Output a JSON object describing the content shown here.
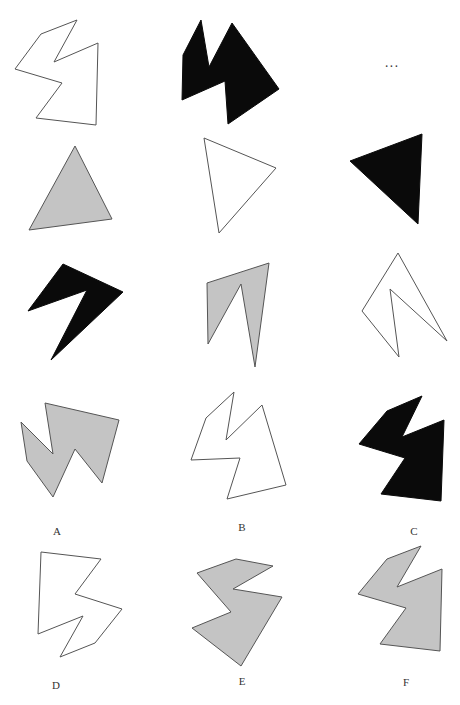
{
  "puzzle": {
    "ellipsis": "...",
    "ellipsis_pos": [
      392,
      63
    ],
    "colors": {
      "white": "#ffffff",
      "gray": "#c4c4c4",
      "black": "#0a0a0a",
      "stroke": "#555555"
    },
    "grid": [
      {
        "id": "r1c1",
        "fill": "white",
        "points": "77,20 41,34 15,69 62,83 36,118 96,125 98,43 54,62"
      },
      {
        "id": "r1c2",
        "fill": "black",
        "points": "201,20 183,55 182,100 225,81 228,124 279,89 232,23 209,67"
      },
      {
        "id": "r2c1",
        "fill": "gray",
        "points": "75,146 29,230 112,219"
      },
      {
        "id": "r2c2",
        "fill": "white",
        "points": "204,138 276,168 219,233"
      },
      {
        "id": "r2c3",
        "fill": "black",
        "points": "350,161 422,134 418,224"
      },
      {
        "id": "r3c1",
        "fill": "black",
        "points": "63,264 28,311 87,290 51,360 123,292"
      },
      {
        "id": "r3c2",
        "fill": "gray",
        "points": "207,283 269,263 255,367 241,284 208,344"
      },
      {
        "id": "r3c3",
        "fill": "white",
        "points": "398,253 362,311 399,357 390,289 447,341"
      }
    ],
    "options": [
      {
        "label": "A",
        "fill": "gray",
        "label_pos": [
          57,
          531
        ],
        "points": "45,403 119,420 102,483 75,449 53,497 27,461 21,422 53,454"
      },
      {
        "label": "B",
        "fill": "white",
        "label_pos": [
          242,
          527
        ],
        "points": "234,392 206,418 191,460 240,458 227,499 286,485 262,405 226,440"
      },
      {
        "label": "C",
        "fill": "black",
        "label_pos": [
          414,
          531
        ],
        "points": "422,396 387,411 359,444 405,458 381,494 441,501 444,420 402,437"
      },
      {
        "label": "D",
        "fill": "white",
        "label_pos": [
          56,
          685
        ],
        "points": "41,552 101,559 75,594 122,609 95,643 60,657 83,616 38,634"
      },
      {
        "label": "E",
        "fill": "gray",
        "label_pos": [
          242,
          681
        ],
        "points": "236,559 273,566 233,589 282,597 241,666 192,628 231,612 197,573"
      },
      {
        "label": "F",
        "fill": "gray",
        "label_pos": [
          406,
          682
        ],
        "points": "421,546 387,559 358,594 406,608 380,644 440,651 442,569 397,587"
      }
    ]
  }
}
